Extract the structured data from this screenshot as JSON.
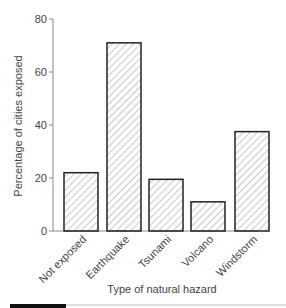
{
  "chart_data": {
    "type": "bar",
    "title": "",
    "xlabel": "Type of natural hazard",
    "ylabel": "Percentage of cities exposed",
    "categories": [
      "Not exposed",
      "Earthquake",
      "Tsunami",
      "Volcano",
      "Windstorm"
    ],
    "values": [
      22,
      71,
      19.5,
      11,
      37.5
    ],
    "ylim": [
      0,
      80
    ],
    "yticks": [
      0,
      20,
      40,
      60,
      80
    ],
    "grid": false,
    "legend": null,
    "bar_fill": "hatched"
  },
  "colors": {
    "bar_stroke": "#222222",
    "hatch": "#666666",
    "axis": "#888888",
    "footer_bar": "#111111",
    "footer_rule": "#bbbbbb"
  }
}
